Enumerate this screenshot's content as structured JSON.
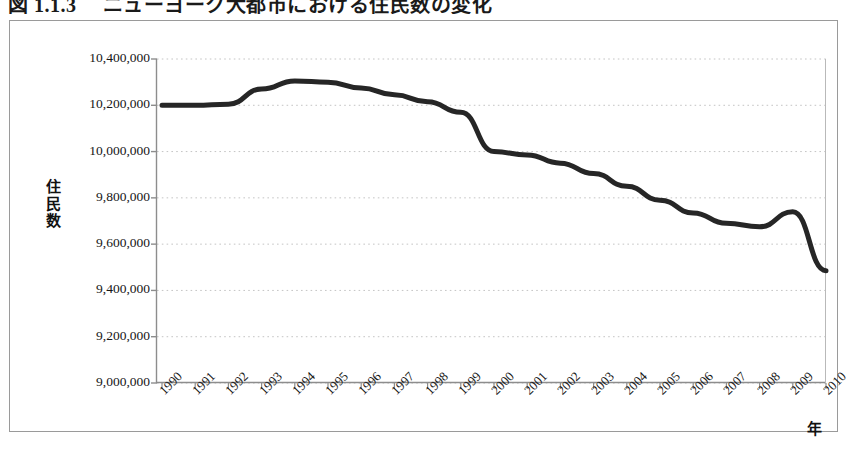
{
  "figure": {
    "title": "図 1.1.3 　ニューヨーク大都市における住民数の変化",
    "x_axis_caption": "年",
    "y_axis_caption": [
      "住",
      "民",
      "数"
    ]
  },
  "chart_data": {
    "type": "line",
    "title": "図 1.1.3 　ニューヨーク大都市における住民数の変化",
    "xlabel": "年",
    "ylabel": "住民数",
    "xlim": [
      1990,
      2010
    ],
    "ylim": [
      9000000,
      10400000
    ],
    "ytick_labels": [
      "10,400,000",
      "10,200,000",
      "10,000,000",
      "9,800,000",
      "9,600,000",
      "9,400,000",
      "9,200,000",
      "9,000,000"
    ],
    "ytick_values": [
      10400000,
      10200000,
      10000000,
      9800000,
      9600000,
      9400000,
      9200000,
      9000000
    ],
    "xtick_labels": [
      "1990",
      "1991",
      "1992",
      "1993",
      "1994",
      "1995",
      "1996",
      "1997",
      "1998",
      "1999",
      "2000",
      "2001",
      "2002",
      "2003",
      "2004",
      "2005",
      "2006",
      "2007",
      "2008",
      "2009",
      "2010"
    ],
    "grid": true,
    "grid_style": "dotted-horizontal",
    "legend": null,
    "line_color": "#262626",
    "line_width_px": 5,
    "categories": [
      1990,
      1991,
      1992,
      1993,
      1994,
      1995,
      1996,
      1997,
      1998,
      1999,
      2000,
      2001,
      2002,
      2003,
      2004,
      2005,
      2006,
      2007,
      2008,
      2009,
      2010
    ],
    "values": [
      10200000,
      10200000,
      10205000,
      10270000,
      10305000,
      10300000,
      10275000,
      10245000,
      10215000,
      10170000,
      10000000,
      9985000,
      9950000,
      9905000,
      9850000,
      9790000,
      9735000,
      9690000,
      9675000,
      9740000,
      9485000
    ]
  }
}
